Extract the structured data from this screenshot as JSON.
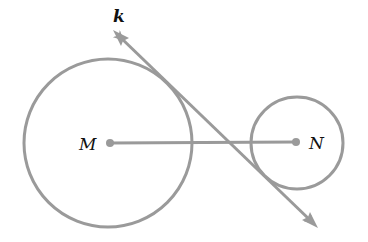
{
  "diagram": {
    "type": "geometry",
    "stroke_color": "#9a9a9a",
    "circles": [
      {
        "name": "M",
        "cx": 108,
        "cy": 143,
        "r": 84
      },
      {
        "name": "N",
        "cx": 297,
        "cy": 143,
        "r": 46
      }
    ],
    "segment": {
      "from": "M",
      "to": "N"
    },
    "line": {
      "name": "k",
      "x1": 113,
      "y1": 30,
      "x2": 318,
      "y2": 228,
      "arrows": "both"
    },
    "labels": {
      "k": "k",
      "M": "M",
      "N": "N"
    }
  }
}
